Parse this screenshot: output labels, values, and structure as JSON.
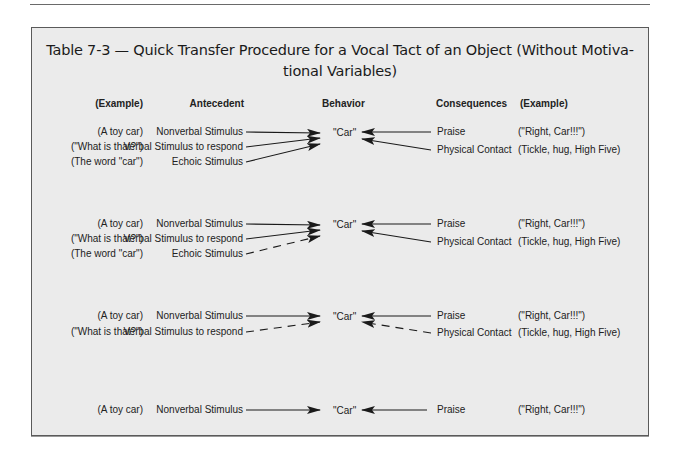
{
  "title_line1": "Table 7-3 — Quick Transfer Procedure for a Vocal Tact of an Object (Without Motiva-",
  "title_line2": "tional Variables)",
  "headers": {
    "example_left": "(Example)",
    "antecedent": "Antecedent",
    "behavior": "Behavior",
    "consequences": "Consequences",
    "example_right": "(Example)"
  },
  "blocks": [
    {
      "antecedents": [
        {
          "example": "(A toy car)",
          "label": "Nonverbal Stimulus",
          "line": "solid"
        },
        {
          "example": "(\"What  is that?\")",
          "label": "Verbal Stimulus to respond",
          "line": "solid"
        },
        {
          "example": "(The word \"car\")",
          "label": "Echoic Stimulus",
          "line": "solid"
        }
      ],
      "behavior": "\"Car\"",
      "consequences": [
        {
          "label": "Praise",
          "example": "(\"Right, Car!!!\")",
          "line": "solid"
        },
        {
          "label": "Physical Contact",
          "example": "(Tickle, hug, High Five)",
          "line": "solid"
        }
      ]
    },
    {
      "antecedents": [
        {
          "example": "(A toy car)",
          "label": "Nonverbal Stimulus",
          "line": "solid"
        },
        {
          "example": "(\"What  is that?\")",
          "label": "Verbal Stimulus to respond",
          "line": "solid"
        },
        {
          "example": "(The word \"car\")",
          "label": "Echoic Stimulus",
          "line": "dashed"
        }
      ],
      "behavior": "\"Car\"",
      "consequences": [
        {
          "label": "Praise",
          "example": "(\"Right, Car!!!\")",
          "line": "solid"
        },
        {
          "label": "Physical Contact",
          "example": "(Tickle, hug, High Five)",
          "line": "solid"
        }
      ]
    },
    {
      "antecedents": [
        {
          "example": "(A toy car)",
          "label": "Nonverbal Stimulus",
          "line": "solid"
        },
        {
          "example": "(\"What  is that?\")",
          "label": "Verbal Stimulus to respond",
          "line": "dashed"
        }
      ],
      "behavior": "\"Car\"",
      "consequences": [
        {
          "label": "Praise",
          "example": "(\"Right, Car!!!\")",
          "line": "solid"
        },
        {
          "label": "Physical Contact",
          "example": "(Tickle, hug, High Five)",
          "line": "dashed"
        }
      ]
    },
    {
      "antecedents": [
        {
          "example": "(A toy car)",
          "label": "Nonverbal Stimulus",
          "line": "solid"
        }
      ],
      "behavior": "\"Car\"",
      "consequences": [
        {
          "label": "Praise",
          "example": "(\"Right, Car!!!\")",
          "line": "solid"
        }
      ]
    }
  ],
  "colors": {
    "box_bg": "#ebebeb",
    "border": "#5a5a5a",
    "text": "#222222"
  }
}
